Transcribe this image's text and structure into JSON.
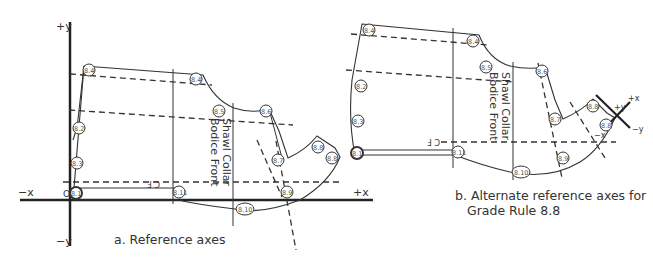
{
  "diagram_a": {
    "caption": "a. Reference axes",
    "axis_labels": {
      "plus_y": "+y",
      "minus_y": "−y",
      "minus_x": "−x",
      "plus_x": "+x",
      "origin": "O"
    },
    "piece_label_line1": "Shawl Collar",
    "piece_label_line2": "Bodice Front",
    "cf_label": "C F",
    "points": [
      "8.1",
      "8.2",
      "8.3",
      "8.4",
      "8.5",
      "8.6",
      "8.7",
      "8.8",
      "8.9",
      "8.10",
      "8.11"
    ]
  },
  "diagram_b": {
    "caption_line1": "b. Alternate reference axes for",
    "caption_line2": "Grade Rule 8.8",
    "axis_labels": {
      "plus_y": "+y",
      "minus_y": "−y",
      "minus_x": "−x",
      "plus_x": "+x"
    },
    "piece_label_line1": "Shawl Collar",
    "piece_label_line2": "Bodice Front",
    "cf_label": "C F",
    "points": [
      "8.1",
      "8.2",
      "8.3",
      "8.4",
      "8.5",
      "8.6",
      "8.7",
      "8.8",
      "8.9",
      "8.10",
      "8.11"
    ]
  }
}
